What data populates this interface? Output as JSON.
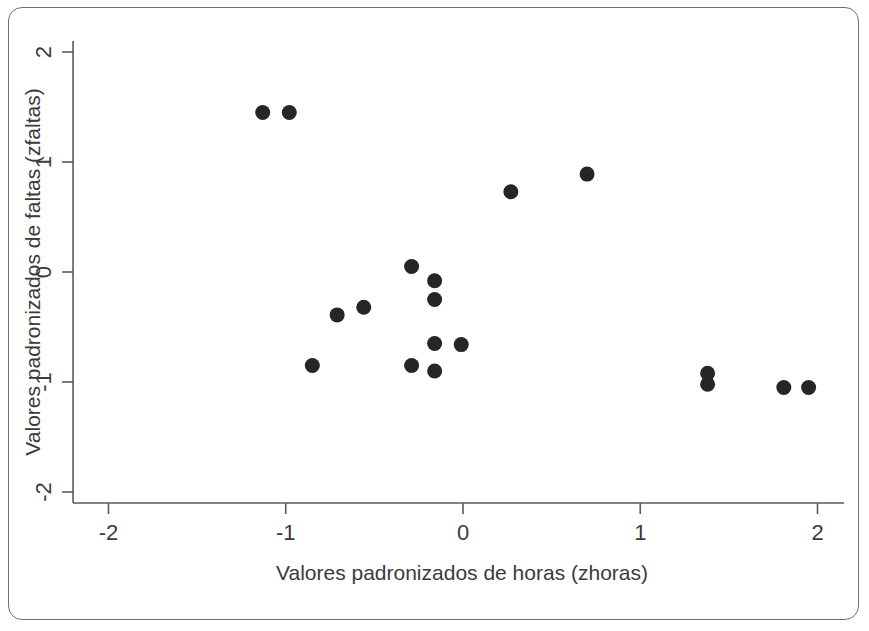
{
  "figure": {
    "frame": {
      "border_color": "#6f6f6f",
      "background": "#ffffff"
    },
    "marker_color": "#262626",
    "axis_color": "#5a5a5a",
    "text_color": "#3b3b3b"
  },
  "chart_data": {
    "type": "scatter",
    "title": "",
    "xlabel": "Valores padronizados de horas (zhoras)",
    "ylabel": "Valores padronizados de faltas (zfaltas)",
    "xlim": [
      -2.2,
      2.15
    ],
    "ylim": [
      -2.1,
      2.1
    ],
    "xticks": [
      -2,
      -1,
      0,
      1,
      2
    ],
    "xticklabels": [
      "-2",
      "-1",
      "0",
      "1",
      "2"
    ],
    "yticks": [
      -2,
      -1,
      0,
      1,
      2
    ],
    "yticklabels": [
      "-2",
      "-1",
      "0",
      "1",
      "2"
    ],
    "grid": false,
    "legend": null,
    "marker": "filled-circle",
    "points": [
      {
        "x": -1.13,
        "y": 1.45
      },
      {
        "x": -0.98,
        "y": 1.45
      },
      {
        "x": 0.27,
        "y": 0.73
      },
      {
        "x": 0.7,
        "y": 0.89
      },
      {
        "x": -0.29,
        "y": 0.05
      },
      {
        "x": -0.16,
        "y": -0.08
      },
      {
        "x": -0.16,
        "y": -0.25
      },
      {
        "x": -0.56,
        "y": -0.32
      },
      {
        "x": -0.71,
        "y": -0.39
      },
      {
        "x": -0.16,
        "y": -0.65
      },
      {
        "x": -0.01,
        "y": -0.66
      },
      {
        "x": -0.85,
        "y": -0.85
      },
      {
        "x": -0.29,
        "y": -0.85
      },
      {
        "x": -0.16,
        "y": -0.9
      },
      {
        "x": 1.38,
        "y": -0.92
      },
      {
        "x": 1.38,
        "y": -1.02
      },
      {
        "x": 1.81,
        "y": -1.05
      },
      {
        "x": 1.95,
        "y": -1.05
      }
    ]
  }
}
